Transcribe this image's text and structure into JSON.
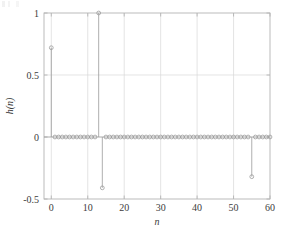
{
  "chart_data": {
    "type": "line",
    "plot_style": "stem",
    "title": "",
    "subtitle": "",
    "xlabel": "n",
    "ylabel": "h(n)",
    "xlim": [
      -2,
      60
    ],
    "ylim": [
      -0.5,
      1
    ],
    "xticks": [
      0,
      10,
      20,
      30,
      40,
      50,
      60
    ],
    "xtick_labels": [
      "0",
      "10",
      "20",
      "30",
      "40",
      "50",
      "60"
    ],
    "yticks": [
      -0.5,
      0,
      0.5,
      1
    ],
    "ytick_labels": [
      "-0.5",
      "0",
      "0.5",
      "1"
    ],
    "grid": true,
    "grid_color": "#d9d9d9",
    "legend": null,
    "marker": "open-circle",
    "line_color": "#9a9a9a",
    "marker_color": "#9a9a9a",
    "axes_color": "#b4b4b4",
    "baseline": 0,
    "x": [
      0,
      1,
      2,
      3,
      4,
      5,
      6,
      7,
      8,
      9,
      10,
      11,
      12,
      13,
      14,
      15,
      16,
      17,
      18,
      19,
      20,
      21,
      22,
      23,
      24,
      25,
      26,
      27,
      28,
      29,
      30,
      31,
      32,
      33,
      34,
      35,
      36,
      37,
      38,
      39,
      40,
      41,
      42,
      43,
      44,
      45,
      46,
      47,
      48,
      49,
      50,
      51,
      52,
      53,
      54,
      55,
      56,
      57,
      58,
      59,
      60
    ],
    "values": [
      0.72,
      0.0,
      0.0,
      0.0,
      0.0,
      0.0,
      0.0,
      0.0,
      0.0,
      0.0,
      0.0,
      0.0,
      0.0,
      1.0,
      -0.41,
      0.0,
      0.0,
      0.0,
      0.0,
      0.0,
      0.0,
      0.0,
      0.0,
      0.0,
      0.0,
      0.0,
      0.0,
      0.0,
      0.0,
      0.0,
      0.0,
      0.0,
      0.0,
      0.0,
      0.0,
      0.0,
      0.0,
      0.0,
      0.0,
      0.0,
      0.0,
      0.0,
      0.0,
      0.0,
      0.0,
      0.0,
      0.0,
      0.0,
      0.0,
      0.0,
      0.0,
      0.0,
      0.0,
      0.0,
      0.0,
      -0.32,
      0.0,
      0.0,
      0.0,
      0.0,
      0.0
    ],
    "notable_points": [
      {
        "n": 0,
        "value": 0.72
      },
      {
        "n": 13,
        "value": 1.0
      },
      {
        "n": 14,
        "value": -0.41
      },
      {
        "n": 55,
        "value": -0.32
      }
    ]
  },
  "figure": {
    "background_color": "#ffffff",
    "plot_area": {
      "left": 44,
      "top": 13,
      "right": 270,
      "bottom": 199
    }
  }
}
